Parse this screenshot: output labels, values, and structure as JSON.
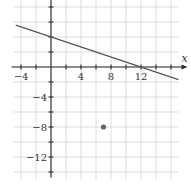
{
  "chart_data": {
    "type": "line",
    "title": "",
    "xlabel": "x",
    "ylabel": "y",
    "xlim": [
      -5,
      17
    ],
    "ylim": [
      -15,
      9
    ],
    "grid": true,
    "grid_step": 2,
    "x_tick_labels": [
      "-4",
      "4",
      "8",
      "12"
    ],
    "x_tick_values": [
      -4,
      4,
      8,
      12
    ],
    "y_tick_labels": [
      "-4",
      "-8",
      "-12"
    ],
    "y_tick_values": [
      -4,
      -8,
      -12
    ],
    "series": [
      {
        "name": "line",
        "kind": "line",
        "equation": "y = -x/3 + 4",
        "slope": -0.3333,
        "y_intercept": 4,
        "x_intercept": 12,
        "x": [
          -4.7,
          17
        ],
        "y": [
          5.57,
          -1.67
        ],
        "color": "#555555"
      },
      {
        "name": "point",
        "kind": "scatter",
        "x": [
          7
        ],
        "y": [
          -8
        ],
        "color": "#666666"
      }
    ]
  }
}
